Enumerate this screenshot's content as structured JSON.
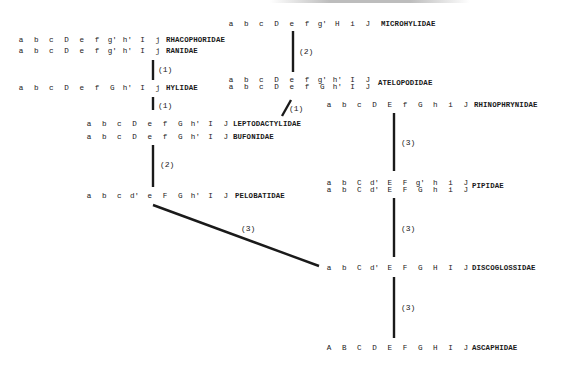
{
  "diagram": {
    "type": "character-state phylogeny of anuran families",
    "families": [
      {
        "id": "microhylidae",
        "name": "MICROHYLIDAE",
        "rows": [
          [
            "a",
            "b",
            "c",
            "D",
            "e",
            "f",
            "g'",
            "H",
            "i",
            "J"
          ]
        ],
        "x": 228,
        "y": 20,
        "label_x": 381
      },
      {
        "id": "rhacophoridae",
        "name": "RHACOPHORIDAE",
        "rows": [
          [
            "a",
            "b",
            "c",
            "D",
            "e",
            "f",
            "g'",
            "h'",
            "I",
            "j"
          ]
        ],
        "x": 18,
        "y": 36,
        "label_x": 166
      },
      {
        "id": "ranidae",
        "name": "RANIDAE",
        "rows": [
          [
            "a",
            "b",
            "c",
            "D",
            "e",
            "f",
            "g'",
            "h'",
            "I",
            "j"
          ]
        ],
        "x": 18,
        "y": 47,
        "label_x": 166
      },
      {
        "id": "hylidae",
        "name": "HYLIDAE",
        "rows": [
          [
            "a",
            "b",
            "c",
            "D",
            "e",
            "f",
            "G",
            "h'",
            "I",
            "j"
          ]
        ],
        "x": 18,
        "y": 84,
        "label_x": 166
      },
      {
        "id": "atelopodidae",
        "name": "ATELOPODIDAE",
        "rows": [
          [
            "a",
            "b",
            "c",
            "D",
            "e",
            "f",
            "g'",
            "h'",
            "I",
            "J"
          ],
          [
            "a",
            "b",
            "c",
            "D",
            "e",
            "f",
            "G",
            "h'",
            "I",
            "J"
          ]
        ],
        "x": 228,
        "y": 76,
        "label_x": 378
      },
      {
        "id": "rhinophrynidae",
        "name": "RHINOPHRYNIDAE",
        "rows": [
          [
            "a",
            "b",
            "c",
            "D",
            "E",
            "f",
            "G",
            "h",
            "i",
            "J"
          ]
        ],
        "x": 326,
        "y": 101,
        "label_x": 474
      },
      {
        "id": "leptodactylidae",
        "name": "LEPTODACTYLIDAE",
        "rows": [
          [
            "a",
            "b",
            "c",
            "D",
            "e",
            "f",
            "G",
            "h'",
            "I",
            "J"
          ]
        ],
        "x": 86,
        "y": 120,
        "label_x": 233
      },
      {
        "id": "bufonidae",
        "name": "BUFONIDAE",
        "rows": [
          [
            "a",
            "b",
            "c",
            "D",
            "e",
            "f",
            "G",
            "h'",
            "I",
            "J"
          ]
        ],
        "x": 86,
        "y": 133,
        "label_x": 233
      },
      {
        "id": "pipidae",
        "name": "PIPIDAE",
        "rows": [
          [
            "a",
            "b",
            "C",
            "d'",
            "E",
            "F",
            "g'",
            "h",
            "i",
            "J"
          ],
          [
            "a",
            "b",
            "C",
            "d'",
            "E",
            "F",
            "G",
            "h",
            "i",
            "J"
          ]
        ],
        "x": 326,
        "y": 179,
        "label_x": 472
      },
      {
        "id": "pelobatidae",
        "name": "PELOBATIDAE",
        "rows": [
          [
            "a",
            "b",
            "c",
            "d'",
            "e",
            "F",
            "G",
            "h'",
            "I",
            "J"
          ]
        ],
        "x": 86,
        "y": 192,
        "label_x": 235
      },
      {
        "id": "discoglossidae",
        "name": "DISCOGLOSSIDAE",
        "rows": [
          [
            "a",
            "b",
            "C",
            "d'",
            "E",
            "F",
            "G",
            "H",
            "I",
            "J"
          ]
        ],
        "x": 326,
        "y": 264,
        "label_x": 472
      },
      {
        "id": "ascaphidae",
        "name": "ASCAPHIDAE",
        "rows": [
          [
            "A",
            "B",
            "C",
            "D",
            "E",
            "F",
            "G",
            "H",
            "I",
            "J"
          ]
        ],
        "x": 326,
        "y": 344,
        "label_x": 472
      }
    ],
    "edges": [
      {
        "from": "microhylidae",
        "to": "atelopodidae",
        "label": "(2)",
        "x1": 293,
        "y1": 31,
        "x2": 293,
        "y2": 72,
        "lx": 299,
        "ly": 47
      },
      {
        "from": "ranidae",
        "to": "hylidae",
        "label": "(1)",
        "x1": 153,
        "y1": 60,
        "x2": 153,
        "y2": 80,
        "lx": 158,
        "ly": 65
      },
      {
        "from": "hylidae",
        "to": "leptodactylidae",
        "label": "(1)",
        "x1": 153,
        "y1": 97,
        "x2": 153,
        "y2": 110,
        "lx": 158,
        "ly": 101
      },
      {
        "from": "atelopodidae",
        "to": "leptodactylidae",
        "label": "(1)",
        "x1": 282,
        "y1": 116,
        "x2": 291,
        "y2": 100,
        "lx": 289,
        "ly": 104
      },
      {
        "from": "rhinophrynidae",
        "to": "pipidae",
        "label": "(3)",
        "x1": 394,
        "y1": 113,
        "x2": 394,
        "y2": 171,
        "lx": 401,
        "ly": 138
      },
      {
        "from": "bufonidae",
        "to": "pelobatidae",
        "label": "(2)",
        "x1": 153,
        "y1": 145,
        "x2": 153,
        "y2": 187,
        "lx": 160,
        "ly": 160
      },
      {
        "from": "pelobatidae",
        "to": "discoglossidae",
        "label": "(3)",
        "x1": 153,
        "y1": 205,
        "x2": 319,
        "y2": 266,
        "lx": 241,
        "ly": 224
      },
      {
        "from": "pipidae",
        "to": "discoglossidae",
        "label": "(3)",
        "x1": 394,
        "y1": 198,
        "x2": 394,
        "y2": 257,
        "lx": 401,
        "ly": 224
      },
      {
        "from": "discoglossidae",
        "to": "ascaphidae",
        "label": "(3)",
        "x1": 394,
        "y1": 277,
        "x2": 394,
        "y2": 338,
        "lx": 401,
        "ly": 303
      }
    ],
    "colors": {
      "ink": "#1a1a1a",
      "paper": "#ffffff"
    }
  }
}
